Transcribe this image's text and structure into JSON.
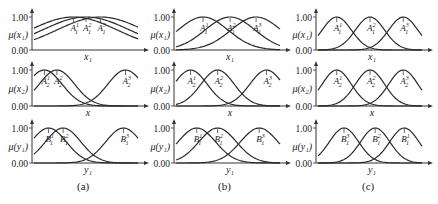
{
  "chart_data": {
    "type": "line",
    "title": "",
    "layout": {
      "rows": 3,
      "cols": 3,
      "grid": false,
      "legend": "none"
    },
    "panels": [
      {
        "caption": "(a)",
        "rows": [
          {
            "ylabel": "μ(x₁)",
            "xlabel": "x₁",
            "yticks": [
              "0.00",
              "1.00"
            ],
            "ylim": [
              0,
              1
            ],
            "xlim": [
              0,
              1
            ],
            "series": [
              {
                "name": "A₁¹",
                "center": 0.38,
                "sigma": 0.42,
                "label": "A",
                "sub": "1",
                "sup": "1"
              },
              {
                "name": "A₁²",
                "center": 0.5,
                "sigma": 0.42,
                "label": "A",
                "sub": "1",
                "sup": "2"
              },
              {
                "name": "A₁³",
                "center": 0.64,
                "sigma": 0.42,
                "label": "A",
                "sub": "1",
                "sup": "3"
              }
            ]
          },
          {
            "ylabel": "μ(x₂)",
            "xlabel": "x",
            "yticks": [
              "0.00",
              "1.00"
            ],
            "ylim": [
              0,
              1
            ],
            "xlim": [
              0,
              1
            ],
            "series": [
              {
                "name": "A₂¹",
                "center": 0.1,
                "sigma": 0.17,
                "label": "A",
                "sub": "2",
                "sup": "1"
              },
              {
                "name": "A₂²",
                "center": 0.22,
                "sigma": 0.17,
                "label": "A",
                "sub": "2",
                "sup": "2"
              },
              {
                "name": "A₂³",
                "center": 0.88,
                "sigma": 0.17,
                "label": "A",
                "sub": "2",
                "sup": "3"
              }
            ]
          },
          {
            "ylabel": "μ(y₁)",
            "xlabel": "y₁",
            "yticks": [
              "0.00",
              "1.00"
            ],
            "ylim": [
              0,
              1
            ],
            "xlim": [
              0,
              1
            ],
            "series": [
              {
                "name": "B₁¹",
                "center": 0.14,
                "sigma": 0.17,
                "label": "B",
                "sub": "1",
                "sup": "1"
              },
              {
                "name": "B₁²",
                "center": 0.28,
                "sigma": 0.17,
                "label": "B",
                "sub": "1",
                "sup": "2"
              },
              {
                "name": "B₁³",
                "center": 0.86,
                "sigma": 0.17,
                "label": "B",
                "sub": "1",
                "sup": "3"
              }
            ]
          }
        ]
      },
      {
        "caption": "(b)",
        "rows": [
          {
            "ylabel": "μ(x₁)",
            "xlabel": "x₁",
            "yticks": [
              "0.00",
              "1.00"
            ],
            "ylim": [
              0,
              1
            ],
            "xlim": [
              0,
              1
            ],
            "series": [
              {
                "name": "A₁¹",
                "center": 0.26,
                "sigma": 0.24,
                "label": "A",
                "sub": "1",
                "sup": "1"
              },
              {
                "name": "A₁²",
                "center": 0.52,
                "sigma": 0.24,
                "label": "A",
                "sub": "1",
                "sup": "2"
              },
              {
                "name": "A₁³",
                "center": 0.77,
                "sigma": 0.24,
                "label": "A",
                "sub": "1",
                "sup": "3"
              }
            ]
          },
          {
            "ylabel": "μ(x₂)",
            "xlabel": "x",
            "yticks": [
              "0.00",
              "1.00"
            ],
            "ylim": [
              0,
              1
            ],
            "xlim": [
              0,
              1
            ],
            "series": [
              {
                "name": "A₂¹",
                "center": 0.14,
                "sigma": 0.16,
                "label": "A",
                "sub": "2",
                "sup": "1"
              },
              {
                "name": "A₂²",
                "center": 0.4,
                "sigma": 0.16,
                "label": "A",
                "sub": "2",
                "sup": "2"
              },
              {
                "name": "A₂³",
                "center": 0.87,
                "sigma": 0.16,
                "label": "A",
                "sub": "2",
                "sup": "3"
              }
            ]
          },
          {
            "ylabel": "μ(y₁)",
            "xlabel": "y₁",
            "yticks": [
              "0.00",
              "1.00"
            ],
            "ylim": [
              0,
              1
            ],
            "xlim": [
              0,
              1
            ],
            "series": [
              {
                "name": "B₁¹",
                "center": 0.2,
                "sigma": 0.18,
                "label": "B",
                "sub": "1",
                "sup": "1"
              },
              {
                "name": "B₁²",
                "center": 0.4,
                "sigma": 0.18,
                "label": "B",
                "sub": "1",
                "sup": "2"
              },
              {
                "name": "B₁³",
                "center": 0.8,
                "sigma": 0.18,
                "label": "B",
                "sub": "1",
                "sup": "3"
              }
            ]
          }
        ]
      },
      {
        "caption": "(c)",
        "rows": [
          {
            "ylabel": "μ(x₁)",
            "xlabel": "x₁",
            "yticks": [
              "0.00",
              "1.00"
            ],
            "ylim": [
              0,
              1
            ],
            "xlim": [
              0,
              1
            ],
            "series": [
              {
                "name": "A₁¹",
                "center": 0.18,
                "sigma": 0.14,
                "label": "A",
                "sub": "1",
                "sup": "1"
              },
              {
                "name": "A₁²",
                "center": 0.5,
                "sigma": 0.14,
                "label": "A",
                "sub": "1",
                "sup": "2"
              },
              {
                "name": "A₁³",
                "center": 0.82,
                "sigma": 0.14,
                "label": "A",
                "sub": "1",
                "sup": "3"
              }
            ]
          },
          {
            "ylabel": "μ(x₂)",
            "xlabel": "x",
            "yticks": [
              "0.00",
              "1.00"
            ],
            "ylim": [
              0,
              1
            ],
            "xlim": [
              0,
              1
            ],
            "series": [
              {
                "name": "A₂¹",
                "center": 0.18,
                "sigma": 0.14,
                "label": "A",
                "sub": "2",
                "sup": "1"
              },
              {
                "name": "A₂²",
                "center": 0.5,
                "sigma": 0.14,
                "label": "A",
                "sub": "2",
                "sup": "2"
              },
              {
                "name": "A₂³",
                "center": 0.82,
                "sigma": 0.14,
                "label": "A",
                "sub": "2",
                "sup": "3"
              }
            ]
          },
          {
            "ylabel": "μ(y₁)",
            "xlabel": "y₁",
            "yticks": [
              "0.00",
              "1.00"
            ],
            "ylim": [
              0,
              1
            ],
            "xlim": [
              0,
              1
            ],
            "series": [
              {
                "name": "B₁³",
                "center": 0.25,
                "sigma": 0.14,
                "label": "B",
                "sub": "1",
                "sup": "3"
              },
              {
                "name": "B₁²",
                "center": 0.55,
                "sigma": 0.14,
                "label": "B",
                "sub": "1",
                "sup": "2"
              },
              {
                "name": "B₁¹",
                "center": 0.83,
                "sigma": 0.14,
                "label": "B",
                "sub": "1",
                "sup": "1"
              }
            ]
          }
        ]
      }
    ]
  },
  "captions": {
    "a": "(a)",
    "b": "(b)",
    "c": "(c)"
  },
  "style": {
    "line_color": "#2a2a2a",
    "text_color": "#222222",
    "axis_color": "#333333"
  }
}
